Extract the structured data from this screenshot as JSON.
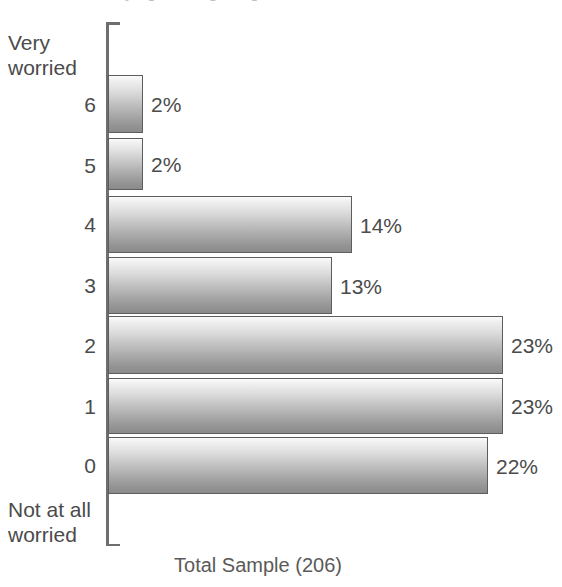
{
  "figure": {
    "cropped_title_fragment": "worrying about getting",
    "caption": "Total Sample (206)"
  },
  "axis": {
    "top_anchor_label_line1": "Very",
    "top_anchor_label_line2": "worried",
    "bottom_anchor_label_line1": "Not at all",
    "bottom_anchor_label_line2": "worried"
  },
  "chart_data": {
    "type": "bar",
    "orientation": "horizontal",
    "title": "",
    "subtitle": "",
    "xlabel": "",
    "ylabel": "",
    "caption": "Total Sample (206)",
    "sample_size": 206,
    "units": "percent",
    "xlim": [
      0,
      25
    ],
    "grid": false,
    "legend": null,
    "axis_anchor_top": "Very worried",
    "axis_anchor_bottom": "Not at all worried",
    "categories": [
      "6",
      "5",
      "4",
      "3",
      "2",
      "1",
      "0"
    ],
    "values": [
      2,
      2,
      14,
      13,
      23,
      23,
      22
    ],
    "data_labels": [
      "2%",
      "2%",
      "14%",
      "13%",
      "23%",
      "23%",
      "22%"
    ],
    "series": [
      {
        "name": "Total Sample",
        "values": [
          2,
          2,
          14,
          13,
          23,
          23,
          22
        ]
      }
    ]
  },
  "rows": [
    {
      "category": "6",
      "label": "2%",
      "value": 2,
      "top": 75,
      "height": 58,
      "width": 35
    },
    {
      "category": "5",
      "label": "2%",
      "value": 2,
      "top": 138,
      "height": 52,
      "width": 35
    },
    {
      "category": "4",
      "label": "14%",
      "value": 14,
      "top": 196,
      "height": 57,
      "width": 244
    },
    {
      "category": "3",
      "label": "13%",
      "value": 13,
      "top": 257,
      "height": 57,
      "width": 224
    },
    {
      "category": "2",
      "label": "23%",
      "value": 23,
      "top": 316,
      "height": 58,
      "width": 395
    },
    {
      "category": "1",
      "label": "23%",
      "value": 23,
      "top": 378,
      "height": 56,
      "width": 395
    },
    {
      "category": "0",
      "label": "22%",
      "value": 22,
      "top": 437,
      "height": 57,
      "width": 380
    }
  ],
  "colors": {
    "bar_border": "#5d5d5d",
    "bar_gradient_top": "#fbfbfb",
    "bar_gradient_bottom": "#8b8b8b",
    "axis": "#6e6e6e",
    "text": "#4b4b4b",
    "background": "#ffffff"
  }
}
